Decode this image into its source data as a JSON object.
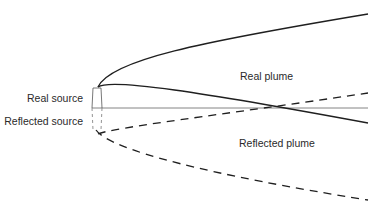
{
  "labels": {
    "real_source": "Real source",
    "reflected_source": "Reflected source",
    "real_plume": "Real plume",
    "reflected_plume": "Reflected plume"
  },
  "colors": {
    "line": "#1f1f1f",
    "ground": "#555555",
    "text": "#2a2a2a"
  }
}
